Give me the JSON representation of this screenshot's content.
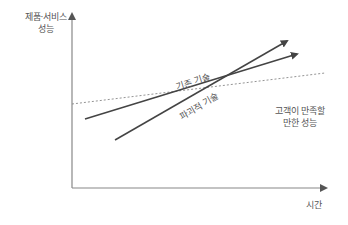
{
  "diagram": {
    "title": "",
    "axes": {
      "y_label_line1": "제품·서비스",
      "y_label_line2": "성능",
      "x_label": "시간"
    },
    "lines": [
      {
        "name": "existing-technology",
        "label": "기존 기술",
        "style": "solid-arrow",
        "from": [
          85,
          119
        ],
        "to": [
          298,
          53
        ]
      },
      {
        "name": "disruptive-technology",
        "label": "파괴적 기술",
        "style": "solid-arrow",
        "from": [
          115,
          140
        ],
        "to": [
          288,
          40
        ]
      },
      {
        "name": "customer-required-performance",
        "label_line1": "고객이 만족할",
        "label_line2": "만한 성능",
        "style": "dashed",
        "from": [
          72,
          104
        ],
        "to": [
          325,
          73
        ]
      }
    ],
    "colors": {
      "axis": "#888888",
      "line": "#444444",
      "dashed": "#888888",
      "text": "#555555"
    }
  }
}
